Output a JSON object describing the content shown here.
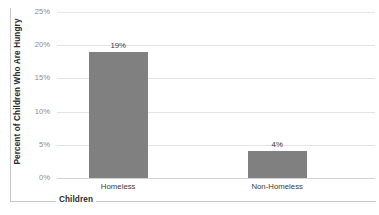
{
  "chart_data": {
    "type": "bar",
    "title": "",
    "categories": [
      "Homeless",
      "Non-Homeless"
    ],
    "values": [
      19,
      4
    ],
    "data_labels": [
      "19%",
      "4%"
    ],
    "xlabel": "Children",
    "ylabel": "Percent of Children Who Are Hungry",
    "ylim": [
      0,
      25
    ],
    "ytick_values": [
      0,
      5,
      10,
      15,
      20,
      25
    ],
    "ytick_labels": [
      "0%",
      "5%",
      "10%",
      "15%",
      "20%",
      "25%"
    ],
    "grid": true,
    "legend": false,
    "legend_position": "none",
    "series_color": "#808080",
    "gridline_color": "#e4e4e4",
    "axis_color": "#c8c8c8",
    "tick_label_color": "#8a8a8a",
    "bar_plot_fraction": 0.76
  }
}
